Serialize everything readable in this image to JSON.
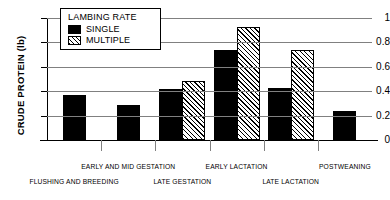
{
  "chart_data": {
    "type": "bar",
    "title": "",
    "xlabel": "",
    "ylabel": "CRUDE PROTEIN (lb)",
    "ylim": [
      0,
      1
    ],
    "yticks": [
      "0",
      "0.2",
      "0.4",
      "0.6",
      "0.8",
      "1"
    ],
    "grid": true,
    "legend_position": "upper-left-inside",
    "legend_title": "LAMBING RATE",
    "categories": [
      "FLUSHING AND BREEDING",
      "EARLY AND MID GESTATION",
      "LATE GESTATION",
      "EARLY LACTATION",
      "LATE LACTATION",
      "POSTWEANING"
    ],
    "series": [
      {
        "name": "SINGLE",
        "values": [
          0.37,
          0.29,
          0.42,
          0.74,
          0.43,
          0.24
        ]
      },
      {
        "name": "MULTIPLE",
        "values": [
          null,
          null,
          0.48,
          0.93,
          0.74,
          null
        ]
      }
    ]
  },
  "legend": {
    "title": "LAMBING RATE",
    "entries": [
      {
        "label": "SINGLE",
        "swatch": "solid-black-swatch"
      },
      {
        "label": "MULTIPLE",
        "swatch": "hatched-swatch"
      }
    ]
  },
  "axes": {
    "y_title": "CRUDE PROTEIN (lb)",
    "y_ticks": [
      "1",
      "0.8",
      "0.6",
      "0.4",
      "0.2",
      "0"
    ]
  }
}
